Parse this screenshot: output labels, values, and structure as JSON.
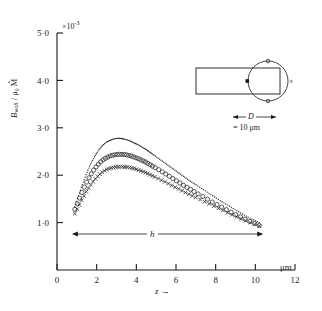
{
  "figure": {
    "background": "#ffffff",
    "ink": "#1a1a1a"
  },
  "axes": {
    "x_label": "z",
    "x_arrow": "→",
    "x_unit": "μm",
    "x_ticks": [
      "0",
      "2",
      "4",
      "6",
      "8",
      "10",
      "12"
    ],
    "x_tick_values": [
      0,
      2,
      4,
      6,
      8,
      10,
      12
    ],
    "x_min": 0,
    "x_max": 12,
    "y_label_main": "B",
    "y_label_sub": "wall",
    "y_label_denom": "μ₀ M̂",
    "y_ticks": [
      "1·0",
      "2·0",
      "3·0",
      "4·0",
      "5·0"
    ],
    "y_tick_values": [
      1.0,
      2.0,
      3.0,
      4.0,
      5.0
    ],
    "y_min": 0,
    "y_max": 5.0,
    "exponent_label": "×10",
    "exponent_power": "-3"
  },
  "annotations": {
    "h_label": "h",
    "h_span_start_um": 0.75,
    "h_span_end_um": 10.4,
    "inset_D_label": "D",
    "inset_equals_label": "= 10 μm",
    "inset_cross_marker": "×"
  },
  "chart_data": {
    "type": "line",
    "title": "",
    "xlabel": "z",
    "ylabel": "B_wall / μ₀ M̂",
    "xlim": [
      0,
      12
    ],
    "ylim": [
      0,
      5.0
    ],
    "y_scale": 0.001,
    "x_unit": "μm",
    "grid": false,
    "legend_position": "none",
    "series": [
      {
        "name": "dotted-upper",
        "marker": "dotted-line",
        "x": [
          0.9,
          1.1,
          1.3,
          1.5,
          1.7,
          1.9,
          2.1,
          2.3,
          2.5,
          2.7,
          2.9,
          3.1,
          3.3,
          3.5,
          3.7,
          3.9,
          4.1,
          4.3,
          4.5,
          4.7,
          4.9,
          5.2,
          5.5,
          5.8,
          6.1,
          6.4,
          6.7,
          7.0,
          7.4,
          7.8,
          8.2,
          8.6,
          9.0,
          9.4,
          9.8,
          10.2
        ],
        "y": [
          1.33,
          1.58,
          1.83,
          2.05,
          2.24,
          2.4,
          2.53,
          2.63,
          2.7,
          2.74,
          2.77,
          2.78,
          2.77,
          2.75,
          2.72,
          2.68,
          2.64,
          2.59,
          2.54,
          2.48,
          2.42,
          2.33,
          2.24,
          2.15,
          2.06,
          1.97,
          1.88,
          1.8,
          1.69,
          1.58,
          1.47,
          1.37,
          1.27,
          1.17,
          1.08,
          1.0
        ]
      },
      {
        "name": "open-circles",
        "marker": "circle",
        "x": [
          0.9,
          1.1,
          1.3,
          1.5,
          1.7,
          1.9,
          2.1,
          2.3,
          2.5,
          2.7,
          2.9,
          3.1,
          3.3,
          3.5,
          3.7,
          3.9,
          4.1,
          4.3,
          4.5,
          4.7,
          4.9,
          5.2,
          5.5,
          5.8,
          6.1,
          6.4,
          6.7,
          7.0,
          7.4,
          7.8,
          8.2,
          8.6,
          9.0,
          9.4,
          9.8,
          10.2
        ],
        "y": [
          1.28,
          1.48,
          1.68,
          1.86,
          2.01,
          2.14,
          2.24,
          2.32,
          2.37,
          2.41,
          2.43,
          2.44,
          2.44,
          2.43,
          2.41,
          2.38,
          2.35,
          2.31,
          2.27,
          2.22,
          2.17,
          2.1,
          2.02,
          1.94,
          1.86,
          1.78,
          1.71,
          1.63,
          1.54,
          1.44,
          1.35,
          1.26,
          1.17,
          1.09,
          1.01,
          0.94
        ]
      },
      {
        "name": "crosses",
        "marker": "cross",
        "x": [
          0.9,
          1.1,
          1.3,
          1.5,
          1.7,
          1.9,
          2.1,
          2.3,
          2.5,
          2.7,
          2.9,
          3.1,
          3.3,
          3.5,
          3.7,
          3.9,
          4.1,
          4.3,
          4.5,
          4.7,
          4.9,
          5.2,
          5.5,
          5.8,
          6.1,
          6.4,
          6.7,
          7.0,
          7.4,
          7.8,
          8.2,
          8.6,
          9.0,
          9.4,
          9.8,
          10.2
        ],
        "y": [
          1.19,
          1.35,
          1.52,
          1.67,
          1.8,
          1.91,
          2.0,
          2.07,
          2.12,
          2.15,
          2.17,
          2.18,
          2.18,
          2.17,
          2.16,
          2.14,
          2.11,
          2.08,
          2.05,
          2.01,
          1.97,
          1.91,
          1.85,
          1.78,
          1.72,
          1.65,
          1.59,
          1.53,
          1.45,
          1.37,
          1.29,
          1.21,
          1.13,
          1.06,
          0.99,
          0.93
        ]
      }
    ]
  }
}
